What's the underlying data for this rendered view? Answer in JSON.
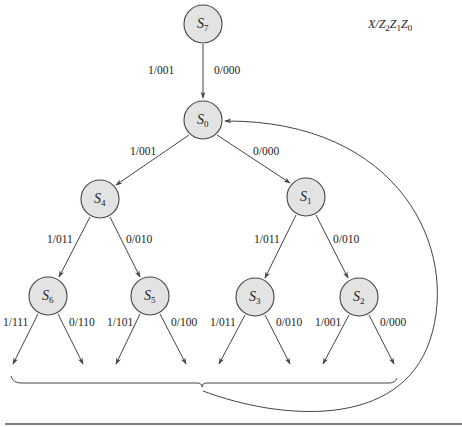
{
  "diagram": {
    "type": "state-transition-tree",
    "legend": {
      "base": "X/Z",
      "parts": [
        {
          "t": "X/Z",
          "s": "2"
        },
        {
          "t": "Z",
          "s": "1"
        },
        {
          "t": "Z",
          "s": "0"
        }
      ]
    },
    "states": [
      {
        "id": "S7",
        "letter": "S",
        "sub": "7",
        "x": 203,
        "y": 24
      },
      {
        "id": "S0",
        "letter": "S",
        "sub": "0",
        "x": 203,
        "y": 120
      },
      {
        "id": "S4",
        "letter": "S",
        "sub": "4",
        "x": 100,
        "y": 199
      },
      {
        "id": "S1",
        "letter": "S",
        "sub": "1",
        "x": 306,
        "y": 197
      },
      {
        "id": "S6",
        "letter": "S",
        "sub": "6",
        "x": 48,
        "y": 296
      },
      {
        "id": "S5",
        "letter": "S",
        "sub": "5",
        "x": 150,
        "y": 296
      },
      {
        "id": "S3",
        "letter": "S",
        "sub": "3",
        "x": 255,
        "y": 297
      },
      {
        "id": "S2",
        "letter": "S",
        "sub": "2",
        "x": 359,
        "y": 297
      }
    ],
    "transitions": [
      {
        "from": "S7",
        "to": "S0",
        "label_left": "1/001",
        "label_right": "0/000"
      },
      {
        "from": "S0",
        "to": "S4",
        "label": "1/001"
      },
      {
        "from": "S0",
        "to": "S1",
        "label": "0/000"
      },
      {
        "from": "S4",
        "to": "S6",
        "label": "1/011"
      },
      {
        "from": "S4",
        "to": "S5",
        "label": "0/010"
      },
      {
        "from": "S1",
        "to": "S3",
        "label": "1/011"
      },
      {
        "from": "S1",
        "to": "S2",
        "label": "0/010"
      },
      {
        "from": "S6",
        "to": "out",
        "label": "1/111"
      },
      {
        "from": "S6",
        "to": "out",
        "label": "0/110"
      },
      {
        "from": "S5",
        "to": "out",
        "label": "1/101"
      },
      {
        "from": "S5",
        "to": "out",
        "label": "0/100"
      },
      {
        "from": "S3",
        "to": "out",
        "label": "1/011"
      },
      {
        "from": "S3",
        "to": "out",
        "label": "0/010"
      },
      {
        "from": "S2",
        "to": "out",
        "label": "1/001"
      },
      {
        "from": "S2",
        "to": "out",
        "label": "0/000"
      },
      {
        "from": "all-outputs",
        "to": "S0",
        "label": ""
      }
    ],
    "edge_labels": {
      "s7_left": "1/001",
      "s7_right": "0/000",
      "s0_left": "1/001",
      "s0_right": "0/000",
      "s4_left": "1/011",
      "s4_right": "0/010",
      "s1_left": "1/011",
      "s1_right": "0/010",
      "s6_left": "1/111",
      "s6_right": "0/110",
      "s5_left": "1/101",
      "s5_right": "0/100",
      "s3_left": "1/011",
      "s3_right": "0/010",
      "s2_left": "1/001",
      "s2_right": "0/000"
    },
    "state_labels": {
      "s7": {
        "l": "S",
        "n": "7"
      },
      "s0": {
        "l": "S",
        "n": "0"
      },
      "s4": {
        "l": "S",
        "n": "4"
      },
      "s1": {
        "l": "S",
        "n": "1"
      },
      "s6": {
        "l": "S",
        "n": "6"
      },
      "s5": {
        "l": "S",
        "n": "5"
      },
      "s3": {
        "l": "S",
        "n": "3"
      },
      "s2": {
        "l": "S",
        "n": "2"
      }
    },
    "legend_parts": {
      "a": "X/Z",
      "a_sub": "2",
      "b": "Z",
      "b_sub": "1",
      "c": "Z",
      "c_sub": "0"
    }
  }
}
